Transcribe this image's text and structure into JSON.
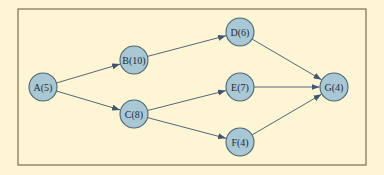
{
  "colors": {
    "background": "#fdf5d4",
    "frame": "#857a5c",
    "node_fill": "#a9c8d5",
    "node_stroke": "#4d6572",
    "edge": "#3f5672",
    "label": "#1e2a33"
  },
  "frame": {
    "x": 18,
    "y": 9,
    "width": 348,
    "height": 156
  },
  "node_radius": 14,
  "nodes": [
    {
      "id": "A",
      "label": "A(5)",
      "duration": 5,
      "x": 43,
      "y": 87
    },
    {
      "id": "B",
      "label": "B(10)",
      "duration": 10,
      "x": 134,
      "y": 60
    },
    {
      "id": "C",
      "label": "C(8)",
      "duration": 8,
      "x": 134,
      "y": 114
    },
    {
      "id": "D",
      "label": "D(6)",
      "duration": 6,
      "x": 240,
      "y": 32
    },
    {
      "id": "E",
      "label": "E(7)",
      "duration": 7,
      "x": 240,
      "y": 87
    },
    {
      "id": "F",
      "label": "F(4)",
      "duration": 4,
      "x": 240,
      "y": 142
    },
    {
      "id": "G",
      "label": "G(4)",
      "duration": 4,
      "x": 334,
      "y": 87
    }
  ],
  "edges": [
    {
      "from": "A",
      "to": "B"
    },
    {
      "from": "A",
      "to": "C"
    },
    {
      "from": "B",
      "to": "D"
    },
    {
      "from": "C",
      "to": "E"
    },
    {
      "from": "C",
      "to": "F"
    },
    {
      "from": "D",
      "to": "G"
    },
    {
      "from": "E",
      "to": "G"
    },
    {
      "from": "F",
      "to": "G"
    }
  ]
}
